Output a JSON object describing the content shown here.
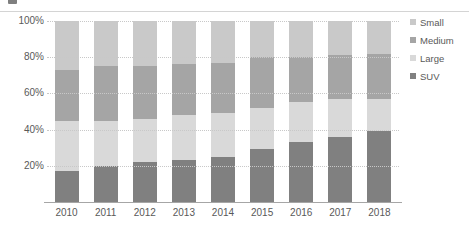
{
  "chart_data": {
    "type": "bar",
    "subtype": "stacked-percent",
    "title": "",
    "xlabel": "",
    "ylabel": "",
    "ylim": [
      0,
      100
    ],
    "ytick_labels": [
      "100%",
      "80%",
      "60%",
      "40%",
      "20%"
    ],
    "ytick_values": [
      100,
      80,
      60,
      40,
      20
    ],
    "grid": true,
    "legend_position": "right",
    "categories": [
      "2010",
      "2011",
      "2012",
      "2013",
      "2014",
      "2015",
      "2016",
      "2017",
      "2018"
    ],
    "series": [
      {
        "name": "Small",
        "color": "#c9c9c9",
        "values": [
          27,
          25,
          25,
          24,
          23,
          20,
          20,
          19,
          18
        ]
      },
      {
        "name": "Medium",
        "color": "#a5a5a5",
        "values": [
          28,
          30,
          29,
          28,
          28,
          28,
          25,
          24,
          25
        ]
      },
      {
        "name": "Large",
        "color": "#d9d9d9",
        "values": [
          28,
          25,
          24,
          25,
          24,
          23,
          22,
          21,
          18
        ]
      },
      {
        "name": "SUV",
        "color": "#808080",
        "values": [
          17,
          20,
          22,
          23,
          25,
          29,
          33,
          36,
          39
        ]
      }
    ],
    "stack_order_bottom_to_top": [
      "SUV",
      "Large",
      "Medium",
      "Small"
    ]
  },
  "legend": {
    "items": [
      {
        "label": "Small",
        "color": "#c9c9c9"
      },
      {
        "label": "Medium",
        "color": "#a5a5a5"
      },
      {
        "label": "Large",
        "color": "#d9d9d9"
      },
      {
        "label": "SUV",
        "color": "#808080"
      }
    ]
  },
  "colors": {
    "gridline": "#c8c8c8",
    "axis": "#a6a6a6",
    "text": "#595959",
    "background": "#ffffff"
  }
}
